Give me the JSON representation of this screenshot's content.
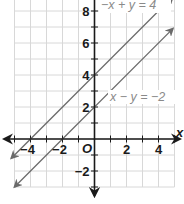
{
  "graph": {
    "origin_px": {
      "x": 94.5,
      "y": 139
    },
    "unit_px": 16,
    "grid": {
      "x_min": -5,
      "x_max": 5,
      "y_min": -3,
      "y_max": 8.7,
      "color": "#d8d8d8"
    },
    "axis_color": "#1a1a1a",
    "x_axis_label": "x",
    "origin_label": "O",
    "x_tick_labels": [
      {
        "value": -4,
        "text": "−4"
      },
      {
        "value": -2,
        "text": "−2"
      },
      {
        "value": 2,
        "text": "2"
      },
      {
        "value": 4,
        "text": "4"
      }
    ],
    "y_tick_labels": [
      {
        "value": 8,
        "text": "8"
      },
      {
        "value": 6,
        "text": "6"
      },
      {
        "value": 4,
        "text": "4"
      },
      {
        "value": 2,
        "text": "2"
      },
      {
        "value": -2,
        "text": "−2"
      }
    ],
    "lines": [
      {
        "name": "line-neg-x-plus-y-eq-4",
        "equation": "−x + y = 4",
        "slope": 1,
        "intercept": 4,
        "x_start": -5.2,
        "x_end": 4.9,
        "color": "#6a6a6a"
      },
      {
        "name": "line-x-minus-y-eq-neg-2",
        "equation": "x − y = −2",
        "slope": 1,
        "intercept": 2,
        "x_start": -5.0,
        "x_end": 4.9,
        "color": "#6a6a6a"
      }
    ],
    "labels": {
      "line1": "−x + y = 4",
      "line2": "x − y = −2"
    }
  }
}
